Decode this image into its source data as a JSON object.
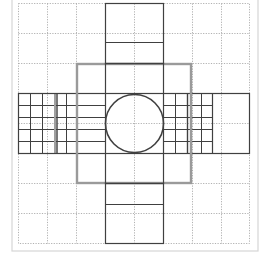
{
  "diagram": {
    "type": "geometric-net",
    "colors": {
      "background": "#ffffff",
      "frame": "#d6d6d6",
      "grid_dotted": "#b0b0b0",
      "outline": "#404040",
      "gray_square": "#9a9a9a"
    },
    "grid": {
      "columns": 8,
      "rows": 8
    },
    "elements": [
      {
        "name": "outer-frame"
      },
      {
        "name": "dotted-grid"
      },
      {
        "name": "top-strip"
      },
      {
        "name": "bottom-strip"
      },
      {
        "name": "gray-square"
      },
      {
        "name": "horizontal-band"
      },
      {
        "name": "left-fine-grid"
      },
      {
        "name": "right-fine-grid"
      },
      {
        "name": "center-square"
      },
      {
        "name": "center-circle"
      }
    ]
  }
}
